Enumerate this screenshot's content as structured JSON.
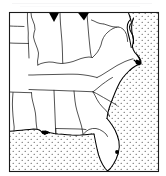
{
  "figure": {
    "kind": "map-figure",
    "title": "",
    "caption": "",
    "alt_text": "Outline map of the southeastern United States with state boundaries, stippled ocean and Gulf of Mexico, and filled locality symbols"
  },
  "map": {
    "name": "southeastern-united-states-outline-map",
    "region_label": "Southeastern United States",
    "projection_note": "",
    "frame": {
      "stroke_color": "#1a1a1a",
      "stroke_width": 1,
      "fill_color": "#ffffff",
      "x": 9,
      "y": 12,
      "width": 150,
      "height": 160
    },
    "land_fill_color": "#ffffff",
    "boundary_color": "#1a1a1a",
    "coastline_color": "#000000",
    "water": {
      "label": "Atlantic Ocean and Gulf of Mexico",
      "pattern": "stipple-dots",
      "dot_color": "#2b2b2b",
      "dot_radius": 0.55,
      "dot_spacing": 6,
      "background_color": "#ffffff"
    },
    "symbols": {
      "marker_color": "#000000",
      "legend_note": "filled locality symbols",
      "items": [
        {
          "id": "marker-1",
          "shape": "triangle-down",
          "label": "",
          "x": 54,
          "y": 13,
          "size": 8
        },
        {
          "id": "marker-2",
          "shape": "triangle-down",
          "label": "",
          "x": 83,
          "y": 13,
          "size": 8
        },
        {
          "id": "marker-3",
          "shape": "blob",
          "label": "",
          "x": 140,
          "y": 63,
          "size": 7
        },
        {
          "id": "marker-4",
          "shape": "blob",
          "label": "",
          "x": 45,
          "y": 133,
          "size": 6
        },
        {
          "id": "marker-5",
          "shape": "dot",
          "label": "",
          "x": 117,
          "y": 152,
          "size": 3
        }
      ]
    },
    "states": [
      {
        "code": "MO",
        "name": "Missouri"
      },
      {
        "code": "IL",
        "name": "Illinois"
      },
      {
        "code": "IN",
        "name": "Indiana"
      },
      {
        "code": "KY",
        "name": "Kentucky"
      },
      {
        "code": "WV",
        "name": "West Virginia"
      },
      {
        "code": "VA",
        "name": "Virginia"
      },
      {
        "code": "MD",
        "name": "Maryland"
      },
      {
        "code": "TN",
        "name": "Tennessee"
      },
      {
        "code": "NC",
        "name": "North Carolina"
      },
      {
        "code": "SC",
        "name": "South Carolina"
      },
      {
        "code": "GA",
        "name": "Georgia"
      },
      {
        "code": "AL",
        "name": "Alabama"
      },
      {
        "code": "MS",
        "name": "Mississippi"
      },
      {
        "code": "AR",
        "name": "Arkansas"
      },
      {
        "code": "LA",
        "name": "Louisiana"
      },
      {
        "code": "FL",
        "name": "Florida"
      }
    ]
  },
  "artifacts": {
    "top_bleed_through_note": "faint scanned text bleed-through above the map frame"
  }
}
